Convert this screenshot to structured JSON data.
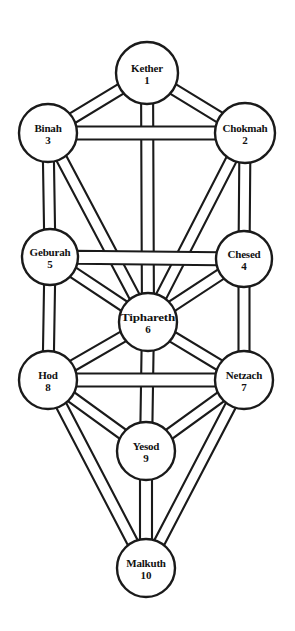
{
  "diagram": {
    "background_color": "#ffffff",
    "ink_color": "#1a1a1a",
    "width": 295,
    "height": 631,
    "style": "double-line ribbon paths, outlined circles, black on white"
  },
  "sephiroth": [
    {
      "key": "kether",
      "name": "Kether",
      "number": "1",
      "cx": 147,
      "cy": 73,
      "r": 31
    },
    {
      "key": "chokmah",
      "name": "Chokmah",
      "number": "2",
      "cx": 245,
      "cy": 133,
      "r": 30
    },
    {
      "key": "binah",
      "name": "Binah",
      "number": "3",
      "cx": 48,
      "cy": 133,
      "r": 29
    },
    {
      "key": "chesed",
      "name": "Chesed",
      "number": "4",
      "cx": 244,
      "cy": 259,
      "r": 28
    },
    {
      "key": "geburah",
      "name": "Geburah",
      "number": "5",
      "cx": 50,
      "cy": 257,
      "r": 28
    },
    {
      "key": "tiphareth",
      "name": "Tiphareth",
      "number": "6",
      "cx": 148,
      "cy": 322,
      "r": 29
    },
    {
      "key": "netzach",
      "name": "Netzach",
      "number": "7",
      "cx": 244,
      "cy": 380,
      "r": 29
    },
    {
      "key": "hod",
      "name": "Hod",
      "number": "8",
      "cx": 48,
      "cy": 380,
      "r": 29
    },
    {
      "key": "yesod",
      "name": "Yesod",
      "number": "9",
      "cx": 146,
      "cy": 451,
      "r": 29
    },
    {
      "key": "malkuth",
      "name": "Malkuth",
      "number": "10",
      "cx": 146,
      "cy": 568,
      "r": 29
    }
  ],
  "paths": [
    {
      "from": "kether",
      "to": "chokmah",
      "width": 11
    },
    {
      "from": "kether",
      "to": "binah",
      "width": 11
    },
    {
      "from": "kether",
      "to": "tiphareth",
      "width": 12
    },
    {
      "from": "binah",
      "to": "chokmah",
      "width": 13
    },
    {
      "from": "binah",
      "to": "geburah",
      "width": 11
    },
    {
      "from": "binah",
      "to": "tiphareth",
      "width": 11
    },
    {
      "from": "chokmah",
      "to": "chesed",
      "width": 11
    },
    {
      "from": "chokmah",
      "to": "tiphareth",
      "width": 11
    },
    {
      "from": "geburah",
      "to": "chesed",
      "width": 13
    },
    {
      "from": "geburah",
      "to": "tiphareth",
      "width": 11
    },
    {
      "from": "geburah",
      "to": "hod",
      "width": 11
    },
    {
      "from": "chesed",
      "to": "tiphareth",
      "width": 11
    },
    {
      "from": "chesed",
      "to": "netzach",
      "width": 11
    },
    {
      "from": "tiphareth",
      "to": "hod",
      "width": 11
    },
    {
      "from": "tiphareth",
      "to": "netzach",
      "width": 11
    },
    {
      "from": "tiphareth",
      "to": "yesod",
      "width": 12
    },
    {
      "from": "hod",
      "to": "netzach",
      "width": 13
    },
    {
      "from": "hod",
      "to": "yesod",
      "width": 11
    },
    {
      "from": "hod",
      "to": "malkuth",
      "width": 11
    },
    {
      "from": "netzach",
      "to": "yesod",
      "width": 11
    },
    {
      "from": "netzach",
      "to": "malkuth",
      "width": 11
    },
    {
      "from": "yesod",
      "to": "malkuth",
      "width": 12
    }
  ]
}
